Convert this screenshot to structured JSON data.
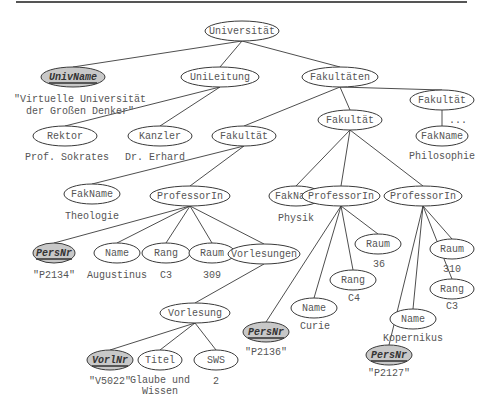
{
  "diagram": {
    "type": "xml-tree",
    "nodes": [
      {
        "id": "universitaet",
        "label": "Universität",
        "x": 242,
        "y": 31,
        "w": 74,
        "key": false
      },
      {
        "id": "univname",
        "label": "UnivName",
        "x": 73,
        "y": 77,
        "w": 64,
        "key": true
      },
      {
        "id": "unileitung",
        "label": "UniLeitung",
        "x": 220,
        "y": 77,
        "w": 78,
        "key": false
      },
      {
        "id": "fakultaeten",
        "label": "Fakultäten",
        "x": 340,
        "y": 77,
        "w": 76,
        "key": false
      },
      {
        "id": "fakultaet-r",
        "label": "Fakultät",
        "x": 442,
        "y": 100,
        "w": 64,
        "key": false
      },
      {
        "id": "rektor",
        "label": "Rektor",
        "x": 65,
        "y": 136,
        "w": 64,
        "key": false
      },
      {
        "id": "kanzler",
        "label": "Kanzler",
        "x": 160,
        "y": 136,
        "w": 64,
        "key": false
      },
      {
        "id": "fakultaet-l",
        "label": "Fakultät",
        "x": 244,
        "y": 136,
        "w": 64,
        "key": false
      },
      {
        "id": "fakultaet-m",
        "label": "Fakultät",
        "x": 350,
        "y": 120,
        "w": 64,
        "key": false
      },
      {
        "id": "fakname-r",
        "label": "FakName",
        "x": 442,
        "y": 136,
        "w": 52,
        "key": false
      },
      {
        "id": "fakname-l",
        "label": "FakName",
        "x": 92,
        "y": 194,
        "w": 56,
        "key": false
      },
      {
        "id": "prof1",
        "label": "ProfessorIn",
        "x": 190,
        "y": 196,
        "w": 80,
        "key": false
      },
      {
        "id": "fakname-m",
        "label": "FakName",
        "x": 296,
        "y": 196,
        "w": 54,
        "key": false
      },
      {
        "id": "prof2",
        "label": "ProfessorIn",
        "x": 341,
        "y": 196,
        "w": 78,
        "key": false
      },
      {
        "id": "prof3",
        "label": "ProfessorIn",
        "x": 423,
        "y": 196,
        "w": 78,
        "key": false
      },
      {
        "id": "persnr1",
        "label": "PersNr",
        "x": 54,
        "y": 253,
        "w": 42,
        "key": true
      },
      {
        "id": "name1",
        "label": "Name",
        "x": 117,
        "y": 253,
        "w": 46,
        "key": false
      },
      {
        "id": "rang1",
        "label": "Rang",
        "x": 166,
        "y": 253,
        "w": 48,
        "key": false
      },
      {
        "id": "raum1",
        "label": "Raum",
        "x": 212,
        "y": 253,
        "w": 46,
        "key": false
      },
      {
        "id": "vorlesungen",
        "label": "Vorlesungen",
        "x": 264,
        "y": 254,
        "w": 72,
        "key": false
      },
      {
        "id": "raum2",
        "label": "Raum",
        "x": 378,
        "y": 244,
        "w": 46,
        "key": false
      },
      {
        "id": "raum3",
        "label": "Raum",
        "x": 452,
        "y": 249,
        "w": 44,
        "key": false
      },
      {
        "id": "rang2",
        "label": "Rang",
        "x": 353,
        "y": 280,
        "w": 46,
        "key": false
      },
      {
        "id": "rang3",
        "label": "Rang",
        "x": 452,
        "y": 289,
        "w": 44,
        "key": false
      },
      {
        "id": "name2",
        "label": "Name",
        "x": 314,
        "y": 308,
        "w": 46,
        "key": false
      },
      {
        "id": "name3",
        "label": "Name",
        "x": 413,
        "y": 319,
        "w": 46,
        "key": false
      },
      {
        "id": "persnr2",
        "label": "PersNr",
        "x": 266,
        "y": 332,
        "w": 46,
        "key": true
      },
      {
        "id": "persnr3",
        "label": "PersNr",
        "x": 389,
        "y": 355,
        "w": 46,
        "key": true
      },
      {
        "id": "vorlesung",
        "label": "Vorlesung",
        "x": 195,
        "y": 313,
        "w": 70,
        "key": false
      },
      {
        "id": "vorlnr",
        "label": "VorlNr",
        "x": 110,
        "y": 360,
        "w": 46,
        "key": true
      },
      {
        "id": "titel",
        "label": "Titel",
        "x": 160,
        "y": 360,
        "w": 44,
        "key": false
      },
      {
        "id": "sws",
        "label": "SWS",
        "x": 216,
        "y": 360,
        "w": 44,
        "key": false
      }
    ],
    "edges": [
      [
        "universitaet",
        "univname"
      ],
      [
        "universitaet",
        "unileitung"
      ],
      [
        "universitaet",
        "fakultaeten"
      ],
      [
        "unileitung",
        "rektor"
      ],
      [
        "unileitung",
        "kanzler"
      ],
      [
        "fakultaeten",
        "fakultaet-l"
      ],
      [
        "fakultaeten",
        "fakultaet-m"
      ],
      [
        "fakultaeten",
        "fakultaet-r"
      ],
      [
        "fakultaet-r",
        "fakname-r"
      ],
      [
        "fakultaet-l",
        "fakname-l"
      ],
      [
        "fakultaet-l",
        "prof1"
      ],
      [
        "fakultaet-m",
        "fakname-m"
      ],
      [
        "fakultaet-m",
        "prof2"
      ],
      [
        "fakultaet-m",
        "prof3"
      ],
      [
        "prof1",
        "persnr1"
      ],
      [
        "prof1",
        "name1"
      ],
      [
        "prof1",
        "rang1"
      ],
      [
        "prof1",
        "raum1"
      ],
      [
        "prof1",
        "vorlesungen"
      ],
      [
        "vorlesungen",
        "vorlesung"
      ],
      [
        "vorlesung",
        "vorlnr"
      ],
      [
        "vorlesung",
        "titel"
      ],
      [
        "vorlesung",
        "sws"
      ],
      [
        "prof2",
        "persnr2"
      ],
      [
        "prof2",
        "name2"
      ],
      [
        "prof2",
        "rang2"
      ],
      [
        "prof2",
        "raum2"
      ],
      [
        "prof3",
        "persnr3"
      ],
      [
        "prof3",
        "name3"
      ],
      [
        "prof3",
        "rang3"
      ],
      [
        "prof3",
        "raum3"
      ]
    ],
    "values": [
      {
        "text": "\"Virtuelle Universität",
        "x": 80,
        "y": 99
      },
      {
        "text": "der Großen Denker\"",
        "x": 80,
        "y": 111
      },
      {
        "text": "Prof. Sokrates",
        "x": 67,
        "y": 157
      },
      {
        "text": "Dr. Erhard",
        "x": 155,
        "y": 157
      },
      {
        "text": "Philosophie",
        "x": 442,
        "y": 156
      },
      {
        "text": "...",
        "x": 458,
        "y": 120
      },
      {
        "text": "Theologie",
        "x": 92,
        "y": 216
      },
      {
        "text": "Physik",
        "x": 296,
        "y": 218
      },
      {
        "text": "\"P2134\"",
        "x": 54,
        "y": 275
      },
      {
        "text": "Augustinus",
        "x": 117,
        "y": 275
      },
      {
        "text": "C3",
        "x": 166,
        "y": 275
      },
      {
        "text": "309",
        "x": 212,
        "y": 275
      },
      {
        "text": "36",
        "x": 379,
        "y": 264
      },
      {
        "text": "310",
        "x": 452,
        "y": 269
      },
      {
        "text": "C4",
        "x": 354,
        "y": 298
      },
      {
        "text": "C3",
        "x": 452,
        "y": 306
      },
      {
        "text": "Curie",
        "x": 315,
        "y": 326
      },
      {
        "text": "Kopernikus",
        "x": 413,
        "y": 338
      },
      {
        "text": "\"P2136\"",
        "x": 266,
        "y": 352
      },
      {
        "text": "\"P2127\"",
        "x": 389,
        "y": 373
      },
      {
        "text": "\"V5022\"",
        "x": 110,
        "y": 381
      },
      {
        "text": "Glaube und",
        "x": 160,
        "y": 380
      },
      {
        "text": "Wissen",
        "x": 160,
        "y": 391
      },
      {
        "text": "2",
        "x": 216,
        "y": 381
      }
    ]
  }
}
